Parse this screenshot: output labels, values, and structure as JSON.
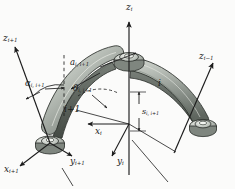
{
  "figure": {
    "type": "engineering-diagram",
    "background_color": "#fbfbfa",
    "line_color": "#1c1c1c",
    "link_fill_light": "#cfd3cd",
    "link_fill_mid": "#9aa29a",
    "link_fill_dark": "#6f776f",
    "link_edge": "#2b2f2b"
  },
  "axes": [
    {
      "id": "z-i",
      "base": "z",
      "sub": "i",
      "x": 128,
      "y": 4,
      "arrow": "up",
      "note": "vertical joint axis i at center pivot"
    },
    {
      "id": "z-i-plus-1",
      "base": "z",
      "sub": "i+1",
      "x": 4,
      "y": 36,
      "arrow": "up-left",
      "note": "joint axis i+1 at left pivot"
    },
    {
      "id": "z-i-minus-1",
      "base": "z",
      "sub": "i−1",
      "x": 200,
      "y": 54,
      "arrow": "up-right",
      "note": "joint axis i-1 at right pivot"
    },
    {
      "id": "x-i",
      "base": "x",
      "sub": "i",
      "x": 97,
      "y": 128,
      "arrow": "left",
      "note": "common normal direction for frame i"
    },
    {
      "id": "y-i",
      "base": "y",
      "sub": "i",
      "x": 119,
      "y": 158,
      "arrow": "down",
      "note": "completes right-handed frame i"
    },
    {
      "id": "x-i-plus-1",
      "base": "x",
      "sub": "i+1",
      "x": 5,
      "y": 166,
      "arrow": "down-left",
      "note": "common normal direction for frame i+1"
    },
    {
      "id": "y-i-plus-1",
      "base": "y",
      "sub": "i+1",
      "x": 72,
      "y": 158,
      "arrow": "down-right",
      "note": "completes right-handed frame i+1"
    }
  ],
  "parameters": [
    {
      "id": "a-i-i-plus-1",
      "base": "a",
      "sub": "i, i+1",
      "x": 71,
      "y": 59,
      "kind": "link-length",
      "note": "common normal length between axes i and i+1"
    },
    {
      "id": "alpha-i-i-plus-1",
      "base": "α",
      "sub": "i, i+1",
      "x": 26,
      "y": 80,
      "kind": "twist-angle",
      "note": "twist angle between z_i and z_{i+1}"
    },
    {
      "id": "theta-i-i-plus-1",
      "base": "θ",
      "sub": "i, i+1",
      "x": 74,
      "y": 85,
      "kind": "joint-angle",
      "note": "joint rotation angle about z_i"
    },
    {
      "id": "s-i-i-plus-1",
      "base": "s",
      "sub": "i, i+1",
      "x": 139,
      "y": 110,
      "kind": "offset",
      "note": "joint offset along z_i"
    }
  ],
  "links": [
    {
      "id": "link-i",
      "label": "i",
      "x": 159,
      "y": 80,
      "note": "right curved link, body i"
    },
    {
      "id": "link-i-plus-1",
      "label": "i+1",
      "x": 66,
      "y": 106,
      "note": "left curved link, body i+1"
    }
  ]
}
